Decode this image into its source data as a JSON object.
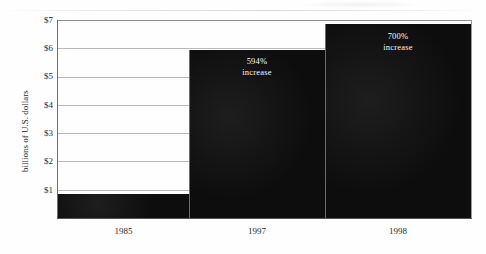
{
  "chart_data": {
    "type": "bar",
    "title": "",
    "subtitle": "",
    "xlabel": "",
    "ylabel": "billions of U.S. dollars",
    "categories": [
      "1985",
      "1997",
      "1998"
    ],
    "values": [
      0.86,
      5.95,
      6.85
    ],
    "annotations": [
      {
        "category": "1985",
        "line1": "",
        "line2": ""
      },
      {
        "category": "1997",
        "line1": "594%",
        "line2": "increase"
      },
      {
        "category": "1998",
        "line1": "700%",
        "line2": "increase"
      }
    ],
    "ylim": [
      0,
      7
    ],
    "yticks": [
      7,
      6,
      5,
      4,
      3,
      2,
      1
    ],
    "ytick_labels": [
      "$7",
      "$6",
      "$5",
      "$4",
      "$3",
      "$2",
      "$1"
    ],
    "grid": true,
    "legend": "none",
    "bar_color": "#131313",
    "gridline_color": "#b9b9b9",
    "axis_color": "#555555",
    "label_text_color": "#ffffff",
    "background_color": "#fefefe"
  },
  "axis": {
    "y_title": "billions of U.S. dollars",
    "y_labels": [
      "$7",
      "$6",
      "$5",
      "$4",
      "$3",
      "$2",
      "$1"
    ],
    "x_labels": [
      "1985",
      "1997",
      "1998"
    ]
  },
  "bars": [
    {
      "name": "1985",
      "label_line1": "",
      "label_line2": ""
    },
    {
      "name": "1997",
      "label_line1": "594%",
      "label_line2": "increase"
    },
    {
      "name": "1998",
      "label_line1": "700%",
      "label_line2": "increase"
    }
  ]
}
